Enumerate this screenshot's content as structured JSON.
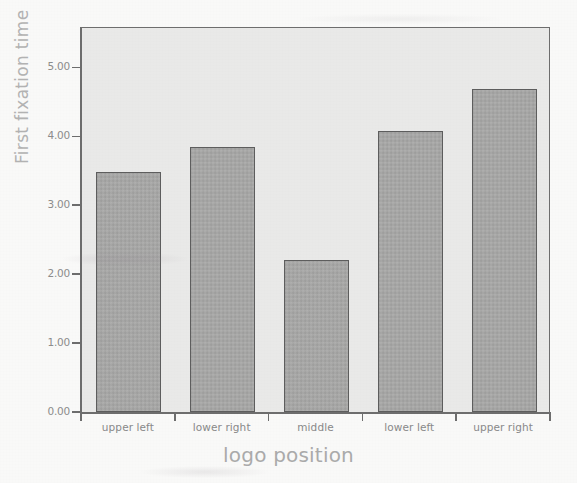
{
  "chart_data": {
    "type": "bar",
    "title": "",
    "categories": [
      "upper left",
      "lower right",
      "middle",
      "lower left",
      "upper right"
    ],
    "values": [
      3.48,
      3.84,
      2.2,
      4.07,
      4.68
    ],
    "xlabel": "logo position",
    "ylabel": "First fixation time",
    "ylim": [
      0.0,
      5.6
    ],
    "yticks": [
      "0.00",
      "1.00",
      "2.00",
      "3.00",
      "4.00",
      "5.00"
    ],
    "ytick_values": [
      0,
      1,
      2,
      3,
      4,
      5
    ],
    "grid": false,
    "legend": "none",
    "bar_color": "#a9a9a8",
    "bar_border_color": "#5f5f5f",
    "plot_background": "#ececeb",
    "axis_color": "#6f6f6f",
    "label_color": "#8b8b8b",
    "title_color": "#adadad"
  }
}
